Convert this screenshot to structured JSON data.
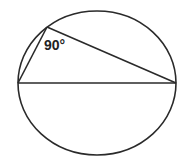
{
  "diagram": {
    "type": "inscribed-right-triangle",
    "angle_label": "90°",
    "stroke_color": "#2a2a2a",
    "circle": {
      "cx": 97,
      "cy": 83,
      "rx": 79,
      "ry": 72
    },
    "diameter": {
      "x1": 18,
      "y1": 83,
      "x2": 176,
      "y2": 83
    },
    "triangle_apex": {
      "x": 47,
      "y": 27
    }
  }
}
